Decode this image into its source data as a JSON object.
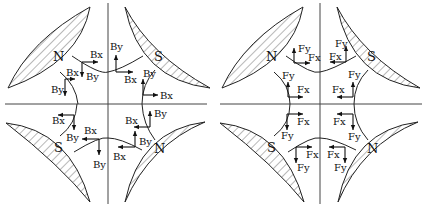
{
  "figure": {
    "left_panel": {
      "name": "field-components",
      "poles": [
        {
          "position": "top-left",
          "label": "N"
        },
        {
          "position": "top-right",
          "label": "S"
        },
        {
          "position": "bottom-left",
          "label": "S"
        },
        {
          "position": "bottom-right",
          "label": "N"
        }
      ],
      "vector_labels": {
        "x": "Bx",
        "y": "By"
      }
    },
    "right_panel": {
      "name": "force-components",
      "poles": [
        {
          "position": "top-left",
          "label": "N"
        },
        {
          "position": "top-right",
          "label": "S"
        },
        {
          "position": "bottom-left",
          "label": "S"
        },
        {
          "position": "bottom-right",
          "label": "N"
        }
      ],
      "vector_labels": {
        "x": "Fx",
        "y": "Fy"
      }
    }
  }
}
